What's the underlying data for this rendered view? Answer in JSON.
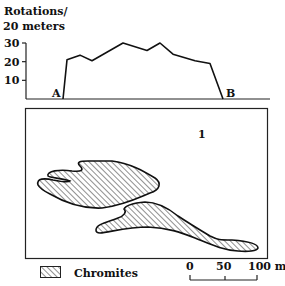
{
  "profile": {
    "ylabel_line1": "Rotations/",
    "ylabel_line2": "20  meters",
    "yticks": [
      {
        "value": 30,
        "label": "30"
      },
      {
        "value": 20,
        "label": "20"
      },
      {
        "value": 10,
        "label": "10"
      }
    ],
    "ylim": [
      0,
      30
    ],
    "start_label": "A",
    "end_label": "B",
    "points": [
      {
        "x": 0,
        "y": 0
      },
      {
        "x": 4,
        "y": 21
      },
      {
        "x": 17,
        "y": 23.5
      },
      {
        "x": 29,
        "y": 20.5
      },
      {
        "x": 60,
        "y": 30
      },
      {
        "x": 84,
        "y": 26
      },
      {
        "x": 97,
        "y": 30
      },
      {
        "x": 110,
        "y": 24
      },
      {
        "x": 132,
        "y": 20.5
      },
      {
        "x": 147,
        "y": 19
      },
      {
        "x": 160,
        "y": 0
      }
    ]
  },
  "map": {
    "area_label": "1",
    "bodies": [
      {
        "name": "upper-chromite-body"
      },
      {
        "name": "lower-chromite-body"
      }
    ]
  },
  "legend": {
    "label": "Chromites"
  },
  "scale_bar": {
    "ticks": [
      "0",
      "50",
      "100 m"
    ]
  }
}
